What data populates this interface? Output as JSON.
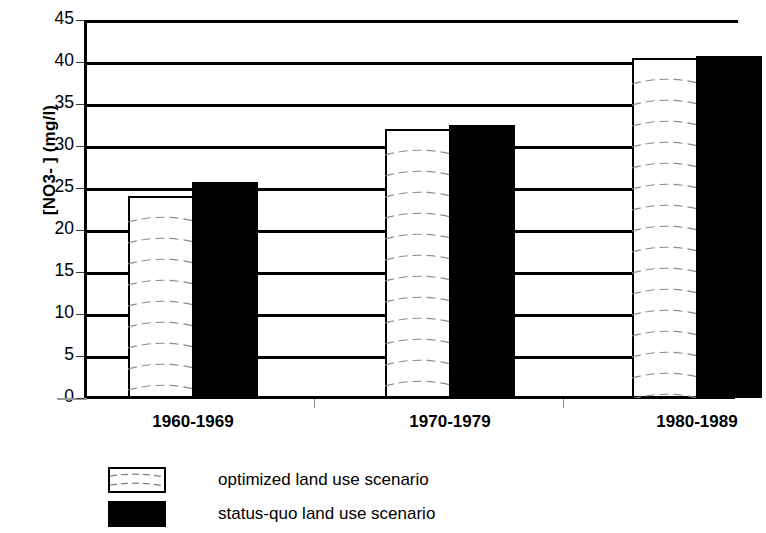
{
  "chart_data": {
    "type": "bar",
    "title": "",
    "xlabel": "",
    "ylabel": "[NO3- ]  (mg/l)",
    "ylim": [
      0,
      45
    ],
    "ytick_step": 5,
    "grid": true,
    "grid_axis": "y",
    "legend_position": "bottom-left",
    "categories": [
      "1960-1969",
      "1970-1979",
      "1980-1989"
    ],
    "yticks": [
      "45",
      "40",
      "35",
      "30",
      "25",
      "20",
      "15",
      "10",
      "5",
      "0"
    ],
    "series": [
      {
        "name": "optimized land use scenario",
        "fill": "white-hatched",
        "color": "#ffffff",
        "edge_color": "#000000",
        "values": [
          24.0,
          32.0,
          40.5
        ]
      },
      {
        "name": "status-quo land use scenario",
        "fill": "solid",
        "color": "#000000",
        "edge_color": "#000000",
        "values": [
          25.7,
          32.5,
          40.7
        ]
      }
    ]
  },
  "legend": {
    "items": [
      {
        "label": "optimized land use scenario",
        "swatch": "optimized"
      },
      {
        "label": "status-quo land use scenario",
        "swatch": "status-quo"
      }
    ]
  }
}
